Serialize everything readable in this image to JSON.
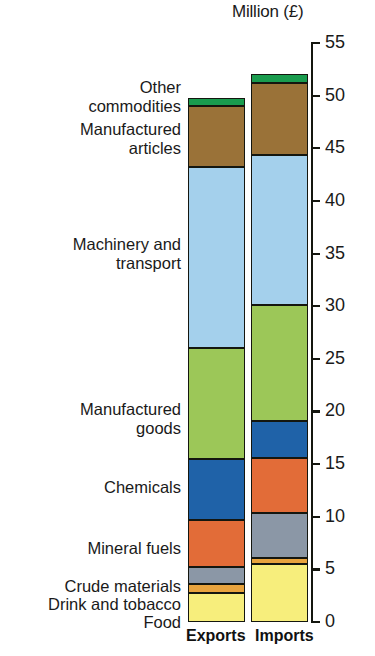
{
  "chart_data": {
    "type": "bar",
    "subtype": "stacked-bar",
    "title": "Million (£)",
    "xlabel": "",
    "ylabel": "Million (£)",
    "ylim": [
      0,
      55
    ],
    "y_ticks": [
      0,
      5,
      10,
      15,
      20,
      25,
      30,
      35,
      40,
      45,
      50,
      55
    ],
    "grid": false,
    "legend_position": "left-labels",
    "categories": [
      "Exports",
      "Imports"
    ],
    "series": [
      {
        "name": "Food",
        "values": [
          2.8,
          5.5
        ],
        "color": "#f7ee7c"
      },
      {
        "name": "Drink and tobacco",
        "values": [
          0.8,
          0.6
        ],
        "color": "#e8a33d"
      },
      {
        "name": "Crude materials",
        "values": [
          1.6,
          4.3
        ],
        "color": "#8b97a6"
      },
      {
        "name": "Mineral fuels",
        "values": [
          4.5,
          5.2
        ],
        "color": "#e26c38"
      },
      {
        "name": "Chemicals",
        "values": [
          5.8,
          3.5
        ],
        "color": "#1f62a8"
      },
      {
        "name": "Manufactured goods",
        "values": [
          10.5,
          11.0
        ],
        "color": "#9cc758"
      },
      {
        "name": "Machinery and transport",
        "values": [
          17.2,
          14.3
        ],
        "color": "#a4d0ec"
      },
      {
        "name": "Manufactured articles",
        "values": [
          5.8,
          6.8
        ],
        "color": "#9a7238"
      },
      {
        "name": "Other commodities",
        "values": [
          0.8,
          0.9
        ],
        "color": "#1a9c4e"
      }
    ],
    "totals": [
      49.8,
      52.1
    ]
  },
  "labels": {
    "other_commodities": "Other\ncommodities",
    "manufactured_articles": "Manufactured\narticles",
    "machinery_and_transport": "Machinery and\ntransport",
    "manufactured_goods": "Manufactured\ngoods",
    "chemicals": "Chemicals",
    "mineral_fuels": "Mineral fuels",
    "crude_materials": "Crude materials",
    "drink_and_tobacco": "Drink and tobacco",
    "food": "Food"
  },
  "axis": {
    "t0": "0",
    "t5": "5",
    "t10": "10",
    "t15": "15",
    "t20": "20",
    "t25": "25",
    "t30": "30",
    "t35": "35",
    "t40": "40",
    "t45": "45",
    "t50": "50",
    "t55": "55"
  },
  "x_axis": {
    "exports": "Exports",
    "imports": "Imports"
  }
}
